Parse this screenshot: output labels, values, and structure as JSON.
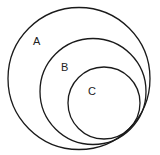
{
  "diagram": {
    "type": "nested-venn",
    "stroke_color": "#1a1a1a",
    "background": "#ffffff",
    "sets": [
      {
        "label": "A",
        "cx": 79,
        "cy": 78.5,
        "r": 71,
        "label_x": 37,
        "label_y": 45
      },
      {
        "label": "B",
        "cx": 93,
        "cy": 91.5,
        "r": 53,
        "label_x": 62,
        "label_y": 71
      },
      {
        "label": "C",
        "cx": 104,
        "cy": 103,
        "r": 36,
        "label_x": 89,
        "label_y": 95
      }
    ]
  }
}
